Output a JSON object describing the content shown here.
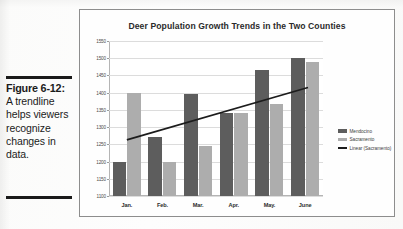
{
  "caption": {
    "figure_number": "Figure 6-12:",
    "body": "A trendline helps viewers recognize changes in data."
  },
  "chart_data": {
    "type": "bar",
    "title": "Deer Population Growth Trends in the Two Counties",
    "xlabel": "",
    "ylabel": "",
    "categories": [
      "Jan.",
      "Feb.",
      "Mar.",
      "Apr.",
      "May.",
      "June"
    ],
    "series": [
      {
        "name": "Mendocino",
        "color": "#5d5d5d",
        "values": [
          1200,
          1270,
          1395,
          1342,
          1465,
          1500
        ]
      },
      {
        "name": "Sacramento",
        "color": "#adadad",
        "values": [
          1400,
          1198,
          1245,
          1342,
          1367,
          1488
        ]
      }
    ],
    "trendline": {
      "name": "Linear (Sacramento)",
      "color": "#1c1c1c",
      "start_value": 1263,
      "end_value": 1415
    },
    "ylim": [
      1100,
      1550
    ],
    "ytick_labels": [
      "1550",
      "1500",
      "1450",
      "1400",
      "1350",
      "1300",
      "1250",
      "1200",
      "1150",
      "1100"
    ],
    "ytick_values": [
      1550,
      1500,
      1450,
      1400,
      1350,
      1300,
      1250,
      1200,
      1150,
      1100
    ],
    "grid": true,
    "legend_position": "right",
    "legend": [
      {
        "label": "Mendocino",
        "marker": "bar-swatch"
      },
      {
        "label": "Sacramento",
        "marker": "bar-swatch"
      },
      {
        "label": "Linear (Sacramento)",
        "marker": "line-swatch"
      }
    ]
  }
}
